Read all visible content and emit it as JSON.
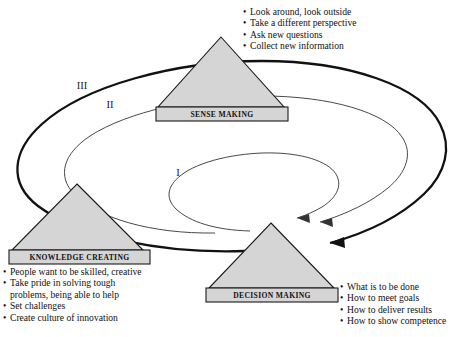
{
  "figure": {
    "rings": [
      {
        "id": "ring-inner",
        "label": "I"
      },
      {
        "id": "ring-mid",
        "label": "II"
      },
      {
        "id": "ring-outer",
        "label": "III"
      }
    ],
    "nodes": [
      {
        "id": "sense-making",
        "label": "SENSE MAKING",
        "bullets": [
          {
            "text": "Look around, look outside",
            "bullet": true
          },
          {
            "text": "Take a different perspective",
            "bullet": true
          },
          {
            "text": "Ask new questions",
            "bullet": true
          },
          {
            "text": "Collect new information",
            "bullet": true
          }
        ]
      },
      {
        "id": "knowledge-creating",
        "label": "KNOWLEDGE CREATING",
        "bullets": [
          {
            "text": "People want to be skilled, creative",
            "bullet": true
          },
          {
            "text": "Take pride in solving tough",
            "bullet": true
          },
          {
            "text": "problems, being able to help",
            "bullet": false
          },
          {
            "text": "Set challenges",
            "bullet": true
          },
          {
            "text": "Create culture of innovation",
            "bullet": true
          }
        ]
      },
      {
        "id": "decision-making",
        "label": "DECISION MAKING",
        "bullets": [
          {
            "text": "What is to be done",
            "bullet": true
          },
          {
            "text": "How to meet goals",
            "bullet": true
          },
          {
            "text": "How to deliver results",
            "bullet": true
          },
          {
            "text": "How to show competence",
            "bullet": true
          }
        ]
      }
    ],
    "bullet_glyph": "•",
    "colors": {
      "shape_fill": "#d5d5d5",
      "stroke": "#111111",
      "thin_stroke": "#333333",
      "background": "#ffffff",
      "text": "#111111"
    }
  }
}
